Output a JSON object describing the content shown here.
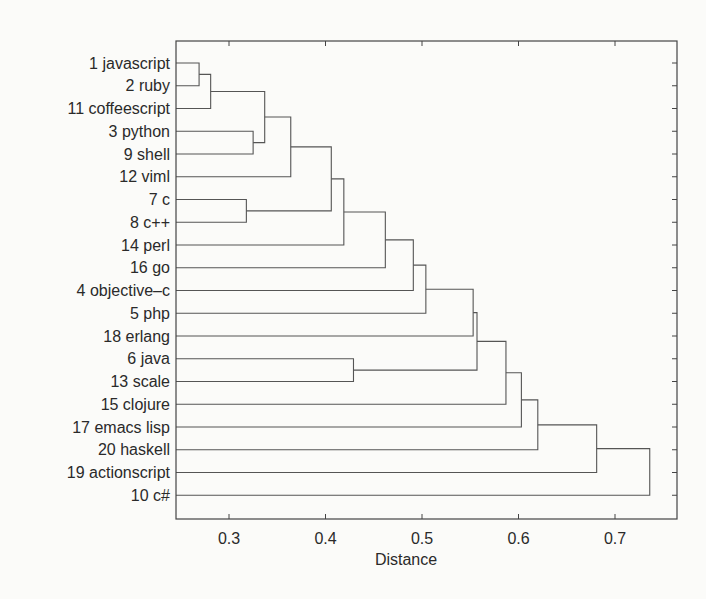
{
  "chart_data": {
    "type": "dendrogram",
    "title": "",
    "xlabel": "Distance",
    "ylabel": "",
    "xlim": [
      0.243,
      0.757
    ],
    "xticks": [
      0.3,
      0.4,
      0.5,
      0.6,
      0.7
    ],
    "xtick_labels": [
      "0.3",
      "0.4",
      "0.5",
      "0.6",
      "0.7"
    ],
    "grid": false,
    "orientation": "horizontal",
    "leaves": [
      "1 javascript",
      "2 ruby",
      "11 coffeescript",
      "3 python",
      "9 shell",
      "12 viml",
      "7 c",
      "8 c++",
      "14 perl",
      "16 go",
      "4 objective–c",
      "5 php",
      "18 erlang",
      "6 java",
      "13 scale",
      "15 clojure",
      "17 emacs lisp",
      "20 haskell",
      "19 actionscript",
      "10 c#"
    ],
    "merges": [
      {
        "id": "A",
        "left": "1 javascript",
        "right": "2 ruby",
        "distance": 0.269
      },
      {
        "id": "B",
        "left": "A",
        "right": "11 coffeescript",
        "distance": 0.281
      },
      {
        "id": "C",
        "left": "3 python",
        "right": "9 shell",
        "distance": 0.325
      },
      {
        "id": "D",
        "left": "B",
        "right": "C",
        "distance": 0.337
      },
      {
        "id": "E",
        "left": "D",
        "right": "12 viml",
        "distance": 0.364
      },
      {
        "id": "F",
        "left": "7 c",
        "right": "8 c++",
        "distance": 0.318
      },
      {
        "id": "G",
        "left": "E",
        "right": "F",
        "distance": 0.406
      },
      {
        "id": "H",
        "left": "G",
        "right": "14 perl",
        "distance": 0.419
      },
      {
        "id": "I",
        "left": "H",
        "right": "16 go",
        "distance": 0.462
      },
      {
        "id": "J",
        "left": "I",
        "right": "4 objective–c",
        "distance": 0.491
      },
      {
        "id": "K",
        "left": "J",
        "right": "5 php",
        "distance": 0.504
      },
      {
        "id": "L",
        "left": "K",
        "right": "18 erlang",
        "distance": 0.553
      },
      {
        "id": "M",
        "left": "6 java",
        "right": "13 scale",
        "distance": 0.429
      },
      {
        "id": "N",
        "left": "L",
        "right": "M",
        "distance": 0.557
      },
      {
        "id": "O",
        "left": "N",
        "right": "15 clojure",
        "distance": 0.587
      },
      {
        "id": "P",
        "left": "O",
        "right": "17 emacs lisp",
        "distance": 0.603
      },
      {
        "id": "Q",
        "left": "P",
        "right": "20 haskell",
        "distance": 0.62
      },
      {
        "id": "R",
        "left": "Q",
        "right": "19 actionscript",
        "distance": 0.681
      },
      {
        "id": "S",
        "left": "R",
        "right": "10 c#",
        "distance": 0.736
      }
    ]
  },
  "style": {
    "line_color": "#555555",
    "frame_color": "#444444",
    "text_color": "#2a2a2a",
    "background": "#fbfbf9"
  }
}
